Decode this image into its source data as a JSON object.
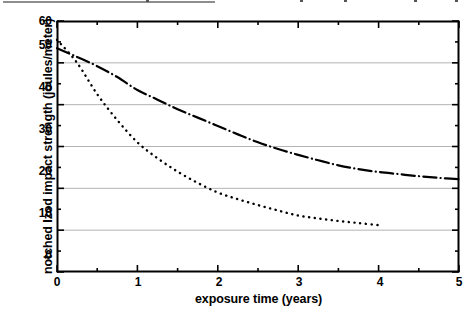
{
  "figure": {
    "top_clip_note": "clipped caption rule",
    "background_color": "#ffffff",
    "ink_color": "#000000",
    "grid_color": "#b4b4b4"
  },
  "chart_data": {
    "type": "line",
    "title": "",
    "xlabel": "exposure time (years)",
    "ylabel": "notched Izod impact strength (joules/meter)",
    "xlim": [
      0,
      5
    ],
    "ylim": [
      0,
      60
    ],
    "xticks": [
      0,
      1,
      2,
      3,
      4,
      5
    ],
    "xtick_labels": [
      "0",
      "1",
      "2",
      "3",
      "4",
      "5"
    ],
    "xminor_ticks": [
      0.5,
      1.5,
      2.5,
      3.5,
      4.5
    ],
    "yticks": [
      0,
      10,
      20,
      30,
      40,
      50,
      60
    ],
    "ytick_labels": [
      "0",
      "10",
      "20",
      "30",
      "40",
      "50",
      "60"
    ],
    "yminor_ticks": [
      5,
      15,
      25,
      35,
      45,
      55
    ],
    "grid": true,
    "grid_axis": "y",
    "grid_values": [
      10,
      20,
      30,
      40,
      50
    ],
    "legend": null,
    "legend_position": "none",
    "series": [
      {
        "name": "dash-dot curve",
        "linestyle": "dashdot",
        "color": "#000000",
        "linewidth": 2.2,
        "x": [
          0,
          0.25,
          0.5,
          0.75,
          1,
          1.25,
          1.5,
          1.75,
          2,
          2.25,
          2.5,
          2.75,
          3,
          3.25,
          3.5,
          3.75,
          4,
          4.25,
          4.5,
          4.75,
          5
        ],
        "values": [
          53.5,
          51.4,
          49.2,
          46.6,
          43.5,
          41.2,
          38.9,
          36.9,
          34.9,
          32.9,
          31.0,
          29.4,
          28.0,
          26.7,
          25.5,
          24.6,
          23.9,
          23.4,
          22.9,
          22.5,
          22.2
        ]
      },
      {
        "name": "dotted curve",
        "linestyle": "dotted",
        "color": "#000000",
        "linewidth": 2.4,
        "x": [
          0,
          0.25,
          0.5,
          0.75,
          1,
          1.25,
          1.5,
          1.75,
          2,
          2.25,
          2.5,
          2.75,
          3,
          3.25,
          3.5,
          3.75,
          4
        ],
        "values": [
          55.5,
          50.0,
          42.5,
          36.3,
          31.0,
          27.2,
          24.0,
          21.3,
          19.0,
          17.4,
          16.0,
          14.7,
          13.5,
          12.8,
          12.2,
          11.7,
          11.2
        ]
      }
    ]
  },
  "axes_geometry": {
    "left_px": 57,
    "right_px": 459,
    "top_px": 21,
    "bottom_px": 272
  }
}
